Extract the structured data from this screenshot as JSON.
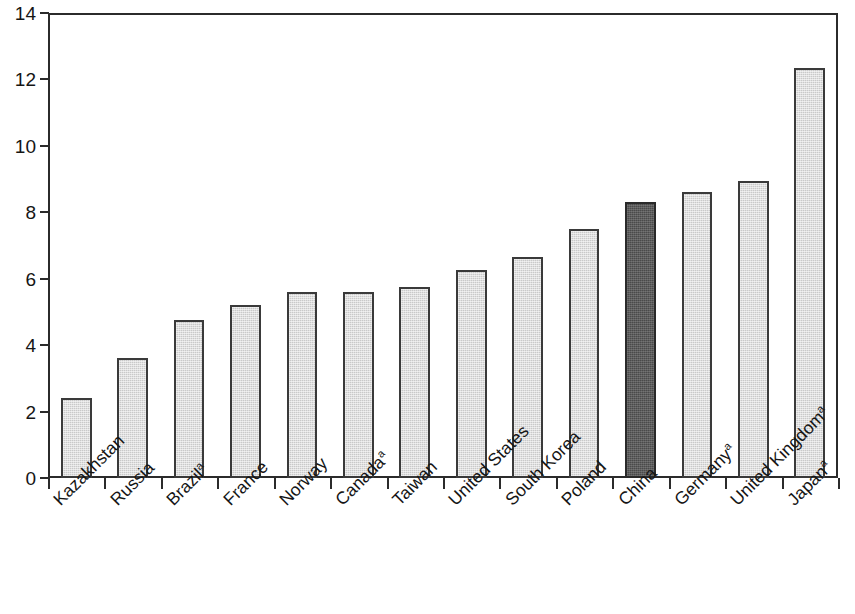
{
  "chart_data": {
    "type": "bar",
    "title": "",
    "subtitle": "",
    "xlabel": "",
    "ylabel": "",
    "ylim": [
      0,
      14
    ],
    "ytick_labels": [
      "0",
      "2",
      "4",
      "6",
      "8",
      "10",
      "12",
      "14"
    ],
    "ytick_values": [
      0,
      2,
      4,
      6,
      8,
      10,
      12,
      14
    ],
    "grid": false,
    "legend": null,
    "categories": [
      "Kazakhstan",
      "Russia",
      "Brazil",
      "France",
      "Norway",
      "Canada",
      "Taiwan",
      "United States",
      "South Korea",
      "Poland",
      "China",
      "Germany",
      "United Kingdom",
      "Japan"
    ],
    "category_footnotes": [
      "",
      "",
      "a",
      "",
      "",
      "a",
      "",
      "",
      "",
      "",
      "",
      "a",
      "a",
      "a"
    ],
    "values": [
      2.4,
      3.6,
      4.75,
      5.2,
      5.6,
      5.6,
      5.75,
      6.25,
      6.65,
      7.5,
      8.3,
      8.6,
      8.95,
      12.35
    ],
    "highlight_category": "China",
    "colors": {
      "bar_fill": "#c9c9c9",
      "bar_outline": "#3a3a3a",
      "highlight_fill": "#4a4a4a",
      "highlight_outline": "#2a2a2a",
      "axis": "#2b2b2b",
      "text": "#151515",
      "background": "#ffffff"
    }
  }
}
